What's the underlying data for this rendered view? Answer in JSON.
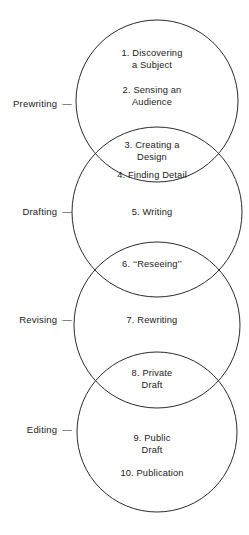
{
  "diagram": {
    "stroke_color": "#2b2b2b",
    "text_color": "#1a1a1a",
    "background": "#ffffff",
    "stage_labels": [
      {
        "name": "prewriting",
        "text": "Prewriting",
        "dash": "—",
        "top": 98
      },
      {
        "name": "drafting",
        "text": "Drafting",
        "dash": "—",
        "top": 206
      },
      {
        "name": "revising",
        "text": "Revising",
        "dash": "—",
        "top": 314
      },
      {
        "name": "editing",
        "text": "Editing",
        "dash": "—",
        "top": 424
      }
    ],
    "circles": [
      {
        "name": "prewriting-circle",
        "cx": 157,
        "cy": 101,
        "r": 81
      },
      {
        "name": "drafting-circle",
        "cx": 157,
        "cy": 212,
        "r": 85
      },
      {
        "name": "revising-circle",
        "cx": 157,
        "cy": 325,
        "r": 83
      },
      {
        "name": "editing-circle",
        "cx": 157,
        "cy": 432,
        "r": 80
      }
    ],
    "steps": [
      {
        "name": "step-1",
        "top": 48,
        "lines": [
          "1. Discovering",
          "a Subject"
        ]
      },
      {
        "name": "step-2",
        "top": 85,
        "lines": [
          "2. Sensing an",
          "Audience"
        ]
      },
      {
        "name": "step-3",
        "top": 140,
        "lines": [
          "3. Creating a",
          "Design"
        ]
      },
      {
        "name": "step-4",
        "top": 170,
        "lines": [
          "4. Finding Detail"
        ]
      },
      {
        "name": "step-5",
        "top": 207,
        "lines": [
          "5. Writing"
        ]
      },
      {
        "name": "step-6",
        "top": 259,
        "lines": [
          "6. ‘‘Reseeing’’"
        ]
      },
      {
        "name": "step-7",
        "top": 315,
        "lines": [
          "7. Rewriting"
        ]
      },
      {
        "name": "step-8",
        "top": 368,
        "lines": [
          "8. Private",
          "Draft"
        ]
      },
      {
        "name": "step-9",
        "top": 433,
        "lines": [
          "9. Public",
          "Draft"
        ]
      },
      {
        "name": "step-10",
        "top": 468,
        "lines": [
          "10. Publication"
        ]
      }
    ]
  }
}
